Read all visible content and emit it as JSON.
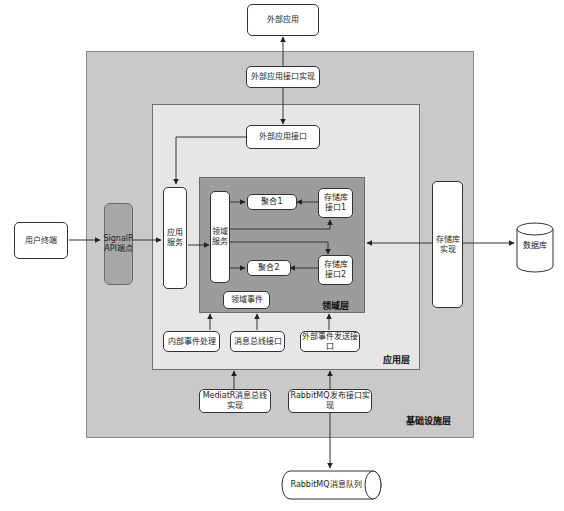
{
  "layers": {
    "infrastructure": {
      "label": "基础设施层",
      "color": "#c9c9c9"
    },
    "application": {
      "label": "应用层",
      "color": "#e6e6e6"
    },
    "domain": {
      "label": "领域层",
      "color": "#9c9c9c"
    }
  },
  "nodes": {
    "external_app": "外部应用",
    "external_app_interface_impl": "外部应用接口实现",
    "external_app_interface": "外部应用接口",
    "user_terminal": "用户终端",
    "signalr_api": "SignalR API端点",
    "app_service": "应用服务",
    "domain_service": "领域服务",
    "aggregate1": "聚合1",
    "aggregate2": "聚合2",
    "repo_interface1": "存储库接口1",
    "repo_interface2": "存储库接口2",
    "domain_event": "领域事件",
    "internal_event_handler": "内部事件处理",
    "message_bus_interface": "消息总线接口",
    "external_event_sender": "外部事件发送接口",
    "repo_impl": "存储库实现",
    "database": "数据库",
    "mediatr_impl": "MediatR消息总线实现",
    "rabbitmq_impl": "RabbitMQ发布接口实现",
    "rabbitmq_queue": "RabbitMQ消息队列"
  }
}
